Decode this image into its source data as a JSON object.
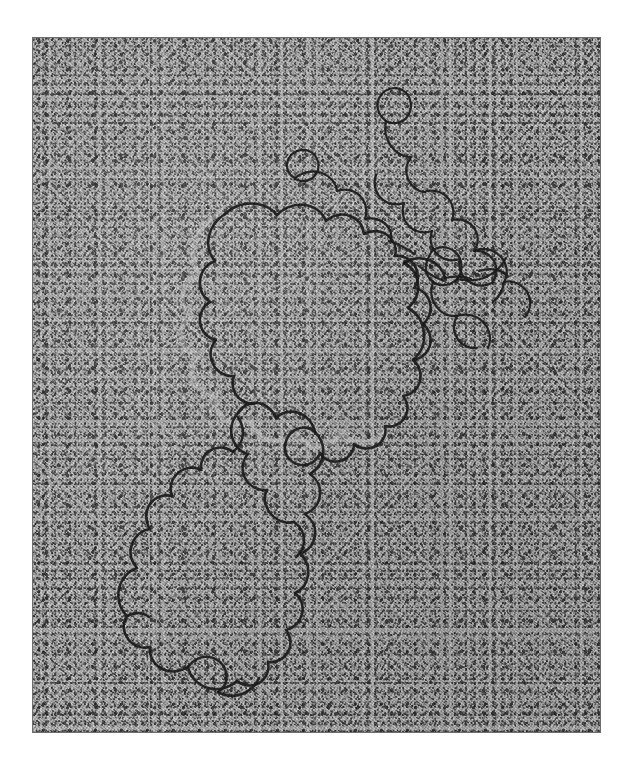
{
  "figure": {
    "kind": "electron-micrograph",
    "medium": "transmission electron micrograph, rotary-shadowed",
    "background_tone": "#a8a8a8",
    "strand_color": "#151515",
    "plate": {
      "left": 33,
      "top": 38,
      "width": 567,
      "height": 694
    },
    "caption": ""
  },
  "specimen": {
    "label": "DNA molecule",
    "features": [
      {
        "name": "relaxed-open-loop",
        "description": "large open circular / relaxed loop occupying the lower-left two thirds of the field",
        "region": "center-left"
      },
      {
        "name": "condensed-tangle",
        "description": "compact supercoiled / tangled knot of strand",
        "region": "upper-right"
      },
      {
        "name": "connecting-segment",
        "description": "single duplex segment linking the relaxed loop to the condensed tangle",
        "region": "upper-center-right"
      }
    ]
  },
  "paths": {
    "main_loop": "M 236 627 C 228 636, 214 640, 200 636 C 188 632, 180 624, 176 614 C 173 606, 174 598, 180 592 C 186 586, 194 584, 200 588 C 205 591, 206 597, 203 602 C 200 607, 194 608, 190 605 C 186 602, 186 596, 189 593 C 178 585, 166 580, 154 582 C 143 584, 134 592, 130 602 C 126 612, 128 622, 136 628 C 126 626, 116 620, 110 611 C 103 601, 101 589, 105 578 C 109 567, 118 559, 128 556 C 120 548, 114 538, 113 527 C 112 516, 116 506, 124 499 C 132 492, 142 489, 151 491 C 148 481, 150 470, 157 462 C 164 454, 174 450, 184 452 C 180 443, 181 433, 187 426 C 193 419, 202 416, 211 418 C 209 409, 212 400, 219 394 C 226 388, 235 386, 243 389 C 243 380, 248 372, 256 368 C 264 364, 273 364, 280 369 C 282 360, 289 353, 298 351 C 307 349, 316 352, 321 359 C 325 350, 333 344, 342 344 C 351 344, 359 349, 362 357 C 368 349, 377 345, 386 347 C 395 349, 402 356, 403 365 C 411 360, 421 360, 428 366 C 435 372, 438 381, 435 389 C 443 387, 452 390, 457 397 C 462 404, 462 413, 457 420 C 465 421, 472 427, 474 435 C 476 443, 473 452, 466 457 C 473 461, 477 469, 476 477 C 475 485, 470 492, 462 494",
    "loop_upper": "M 462 494 C 469 497, 474 504, 474 512 C 474 520, 469 527, 462 530 C 468 536, 470 544, 467 552 C 464 560, 457 565, 449 565 C 452 573, 449 582, 442 587 C 435 592, 426 592, 419 587 C 419 596, 413 604, 404 607 C 395 610, 386 607, 380 600 C 378 609, 370 616, 361 617 C 352 618, 343 614, 339 606 C 335 614, 327 620, 318 620 C 309 620, 301 615, 297 607 C 294 616, 286 622, 277 623 C 268 624, 259 620, 254 612 C 250 620, 243 626, 236 627",
    "loop_left_arc": "M 236 627 C 230 630, 222 632, 214 631",
    "big_loop_outline": "M 318 223 C 300 220, 282 224, 268 234 C 254 244, 245 259, 243 276 C 241 286, 243 296, 248 305 C 238 303, 227 306, 219 313 C 211 320, 206 330, 206 340 C 206 352, 212 363, 221 370 C 212 376, 205 385, 203 396 C 200 408, 203 420, 211 429 C 219 438, 230 443, 242 442 C 240 452, 243 463, 250 471 C 257 479, 267 483, 277 482 C 284 481, 290 478, 295 473",
    "scale": 1
  },
  "annotations": {
    "has_scale_bar": false,
    "has_arrows": false,
    "has_labels": false,
    "visible_text": ""
  }
}
